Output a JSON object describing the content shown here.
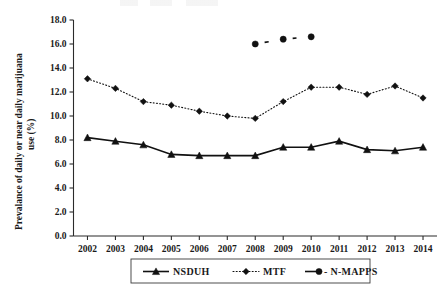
{
  "chart_data": {
    "type": "line",
    "title": "",
    "xlabel": "",
    "ylabel": "Prevalance of daily or near daily marijuana use (%)",
    "ylabel_line1": "Prevalance of daily or near daily marijuana",
    "ylabel_line2": "use (%)",
    "categories": [
      "2002",
      "2003",
      "2004",
      "2005",
      "2006",
      "2007",
      "2008",
      "2009",
      "2010",
      "2011",
      "2012",
      "2013",
      "2014"
    ],
    "ylim": [
      0.0,
      18.0
    ],
    "ytick_step": 2.0,
    "yticks": [
      "0.0",
      "2.0",
      "4.0",
      "6.0",
      "8.0",
      "10.0",
      "12.0",
      "14.0",
      "16.0",
      "18.0"
    ],
    "grid": false,
    "legend_position": "bottom-center",
    "series": [
      {
        "name": "NSDUH",
        "marker": "triangle",
        "line_style": "solid",
        "color": "#111111",
        "x": [
          "2002",
          "2003",
          "2004",
          "2005",
          "2006",
          "2007",
          "2008",
          "2009",
          "2010",
          "2011",
          "2012",
          "2013",
          "2014"
        ],
        "values": [
          8.2,
          7.9,
          7.6,
          6.8,
          6.7,
          6.7,
          6.7,
          7.4,
          7.4,
          7.9,
          7.2,
          7.1,
          7.4
        ]
      },
      {
        "name": "MTF",
        "marker": "diamond",
        "line_style": "dotted",
        "color": "#111111",
        "x": [
          "2002",
          "2003",
          "2004",
          "2005",
          "2006",
          "2007",
          "2008",
          "2009",
          "2010",
          "2011",
          "2012",
          "2013",
          "2014"
        ],
        "values": [
          13.1,
          12.3,
          11.2,
          10.9,
          10.4,
          10.0,
          9.8,
          11.2,
          12.4,
          12.4,
          11.8,
          12.5,
          11.5
        ]
      },
      {
        "name": "N-MAPPS",
        "marker": "circle",
        "line_style": "dashed",
        "color": "#111111",
        "x": [
          "2008",
          "2009",
          "2010"
        ],
        "values": [
          16.0,
          16.4,
          16.6
        ]
      }
    ]
  },
  "legend": {
    "items": [
      {
        "label": "NSDUH",
        "marker": "triangle",
        "line_style": "solid"
      },
      {
        "label": "MTF",
        "marker": "diamond",
        "line_style": "dotted"
      },
      {
        "label": "- N-MAPPS",
        "marker": "circle",
        "line_style": "dashed"
      }
    ]
  }
}
